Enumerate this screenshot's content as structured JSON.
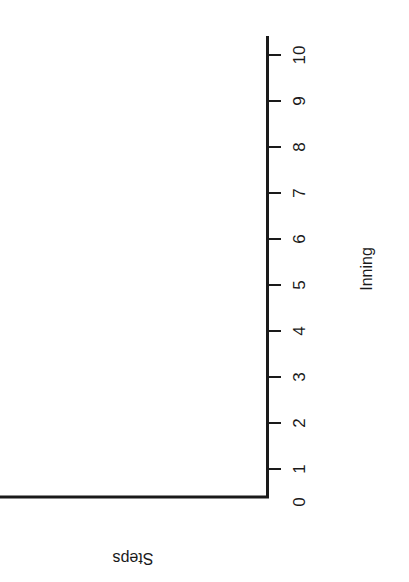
{
  "chart_data": {
    "type": "line",
    "title": "",
    "xlabel": "Inning",
    "ylabel": "Steps",
    "x_ticks": [
      "0",
      "1",
      "2",
      "3",
      "4",
      "5",
      "6",
      "7",
      "8",
      "9",
      "10"
    ],
    "xlim": [
      0,
      10
    ],
    "series": [],
    "grid": false,
    "legend": null,
    "orientation": "rotated 90 degrees; x-axis drawn vertically on right, blank plotting area"
  },
  "axis": {
    "x_title": "Inning",
    "y_title": "Steps",
    "ticks": [
      {
        "label": "0",
        "y": 502
      },
      {
        "label": "1",
        "y": 469
      },
      {
        "label": "2",
        "y": 423
      },
      {
        "label": "3",
        "y": 377
      },
      {
        "label": "4",
        "y": 331
      },
      {
        "label": "5",
        "y": 285
      },
      {
        "label": "6",
        "y": 239
      },
      {
        "label": "7",
        "y": 193
      },
      {
        "label": "8",
        "y": 147
      },
      {
        "label": "9",
        "y": 101
      },
      {
        "label": "10",
        "y": 55
      }
    ]
  },
  "colors": {
    "axis": "#1a1a1a",
    "background": "#ffffff"
  }
}
